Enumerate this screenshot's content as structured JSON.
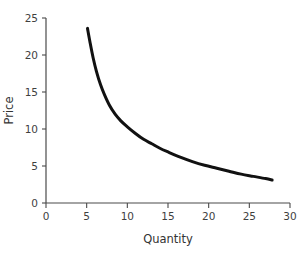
{
  "chart_data": {
    "type": "line",
    "title": "",
    "xlabel": "Quantity",
    "ylabel": "Price",
    "xlim": [
      0,
      30
    ],
    "ylim": [
      0,
      25
    ],
    "xticks": [
      0,
      5,
      10,
      15,
      20,
      25,
      30
    ],
    "yticks": [
      0,
      5,
      10,
      15,
      20,
      25
    ],
    "xtick_labels": [
      "0",
      "5",
      "10",
      "15",
      "20",
      "25",
      "30"
    ],
    "ytick_labels": [
      "0",
      "5",
      "10",
      "15",
      "20",
      "25"
    ],
    "grid": false,
    "legend": null,
    "series": [
      {
        "name": "Demand curve",
        "color": "#111111",
        "line_width": 3,
        "x": [
          5.1,
          5.4,
          5.8,
          6.2,
          6.7,
          7.2,
          7.8,
          8.5,
          9.2,
          10.0,
          11.0,
          12.0,
          13.0,
          14.0,
          15.0,
          16.5,
          18.0,
          19.5,
          21.0,
          22.5,
          24.0,
          25.5,
          27.0,
          27.8
        ],
        "y": [
          23.6,
          21.8,
          19.6,
          17.8,
          16.0,
          14.6,
          13.2,
          12.0,
          11.1,
          10.3,
          9.4,
          8.6,
          8.0,
          7.4,
          6.9,
          6.2,
          5.6,
          5.1,
          4.7,
          4.3,
          3.9,
          3.6,
          3.3,
          3.1
        ]
      }
    ],
    "annotations": []
  },
  "axes": {
    "y_axis_title": "Price",
    "x_axis_title": "Quantity"
  },
  "colors": {
    "curve": "#111111",
    "axis": "#4a4a4a",
    "text": "#3f3f3f",
    "background": "#ffffff"
  }
}
